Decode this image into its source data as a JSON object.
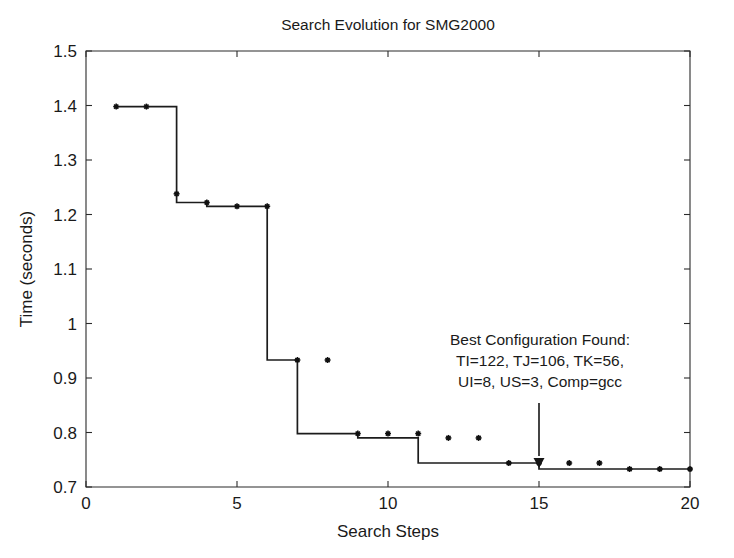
{
  "chart_data": {
    "type": "line",
    "title": "Search Evolution for SMG2000",
    "xlabel": "Search Steps",
    "ylabel": "Time (seconds)",
    "xlim": [
      0,
      20
    ],
    "ylim": [
      0.7,
      1.5
    ],
    "xticks": [
      0,
      5,
      10,
      15,
      20
    ],
    "xtick_labels": [
      "0",
      "5",
      "10",
      "15",
      "20"
    ],
    "yticks": [
      0.7,
      0.8,
      0.9,
      1.0,
      1.1,
      1.2,
      1.3,
      1.4,
      1.5
    ],
    "ytick_labels": [
      "0.7",
      "0.8",
      "0.9",
      "1",
      "1.1",
      "1.2",
      "1.3",
      "1.4",
      "1.5"
    ],
    "grid": false,
    "legend": null,
    "drawstyle": "steps-post",
    "marker": "asterisk",
    "line_color": "#1c1c1c",
    "x": [
      1,
      2,
      3,
      4,
      5,
      6,
      7,
      8,
      9,
      10,
      11,
      12,
      13,
      14,
      15,
      16,
      17,
      18,
      19,
      20
    ],
    "series": [
      {
        "name": "Best time so far",
        "values": [
          1.398,
          1.398,
          1.238,
          1.222,
          1.215,
          1.215,
          0.933,
          0.933,
          0.798,
          0.798,
          0.798,
          0.79,
          0.79,
          0.744,
          0.744,
          0.744,
          0.744,
          0.733,
          0.733,
          0.733
        ]
      }
    ],
    "step_points": [
      {
        "x": 1,
        "y": 1.398
      },
      {
        "x": 2,
        "y": 1.398
      },
      {
        "x": 3,
        "y": 1.238
      },
      {
        "x": 3,
        "y": 1.222
      },
      {
        "x": 4,
        "y": 1.215
      },
      {
        "x": 5,
        "y": 1.215
      },
      {
        "x": 6,
        "y": 0.933
      },
      {
        "x": 7,
        "y": 0.933
      },
      {
        "x": 7,
        "y": 0.798
      },
      {
        "x": 8,
        "y": 0.798
      },
      {
        "x": 9,
        "y": 0.798
      },
      {
        "x": 9,
        "y": 0.79
      },
      {
        "x": 10,
        "y": 0.79
      },
      {
        "x": 11,
        "y": 0.79
      },
      {
        "x": 11,
        "y": 0.744
      },
      {
        "x": 12,
        "y": 0.744
      },
      {
        "x": 13,
        "y": 0.744
      },
      {
        "x": 14,
        "y": 0.744
      },
      {
        "x": 15,
        "y": 0.733
      },
      {
        "x": 16,
        "y": 0.733
      },
      {
        "x": 17,
        "y": 0.733
      },
      {
        "x": 18,
        "y": 0.733
      },
      {
        "x": 19,
        "y": 0.733
      },
      {
        "x": 20,
        "y": 0.733
      }
    ],
    "annotations": [
      {
        "name": "best-configuration-callout",
        "lines": [
          "Best Configuration Found:",
          "TI=122, TJ=106, TK=56,",
          "UI=8, US=3, Comp=gcc"
        ],
        "points_to": {
          "x": 15,
          "y": 0.733
        }
      }
    ]
  }
}
